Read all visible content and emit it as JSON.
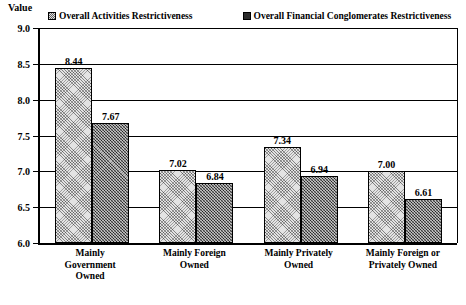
{
  "axis": {
    "value_label": "Value",
    "yticks": [
      "9.0",
      "8.5",
      "8.0",
      "7.5",
      "7.0",
      "6.5",
      "6.0"
    ]
  },
  "legend": {
    "entries": [
      {
        "label": "Overall Activities Restrictiveness",
        "swatch": "hatch-swatch-light"
      },
      {
        "label": "Overall Financial Conglomerates Restrictiveness",
        "swatch": "hatch-swatch-dark"
      }
    ]
  },
  "chart_data": {
    "type": "bar",
    "title": "",
    "xlabel": "",
    "ylabel": "Value",
    "ylim": [
      6.0,
      9.0
    ],
    "ytick_step": 0.5,
    "grid": true,
    "legend_position": "top",
    "categories": [
      "Mainly\nGovernment\nOwned",
      "Mainly Foreign\nOwned",
      "Mainly Privately\nOwned",
      "Mainly Foreign or\nPrivately Owned"
    ],
    "series": [
      {
        "name": "Overall Activities Restrictiveness",
        "values": [
          8.44,
          7.02,
          7.34,
          7.0
        ],
        "labels": [
          "8.44",
          "7.02",
          "7.34",
          "7.00"
        ]
      },
      {
        "name": "Overall Financial Conglomerates Restrictiveness",
        "values": [
          7.67,
          6.84,
          6.94,
          6.61
        ],
        "labels": [
          "7.67",
          "6.84",
          "6.94",
          "6.61"
        ]
      }
    ]
  }
}
